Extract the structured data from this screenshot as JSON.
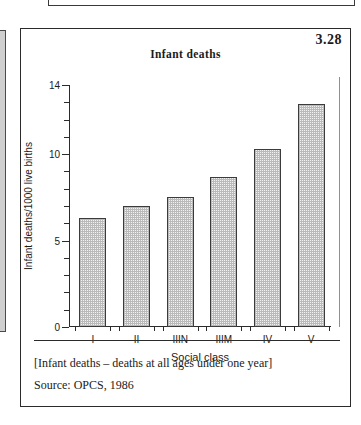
{
  "figure": {
    "number": "3.28",
    "title": "Infant deaths"
  },
  "chart_data": {
    "type": "bar",
    "title": "Infant deaths",
    "categories": [
      "I",
      "II",
      "IIIN",
      "IIIM",
      "IV",
      "V"
    ],
    "values": [
      6.3,
      7.0,
      7.5,
      8.7,
      10.3,
      12.9
    ],
    "xlabel": "Social class",
    "ylabel": "Infant deaths/1000 live births",
    "ylim": [
      0,
      14
    ],
    "ytick_labels": [
      "0",
      "5",
      "10",
      "14"
    ],
    "ytick_values": [
      0,
      5,
      10,
      14
    ],
    "yminor_step": 1,
    "grid": false,
    "legend": null,
    "bar_fill": "#f2f2f2",
    "bar_edge": "#3b3b3b"
  },
  "notes": {
    "bracket_note": "[Infant deaths – deaths at all ages under one year]",
    "source": "Source: OPCS, 1986"
  }
}
